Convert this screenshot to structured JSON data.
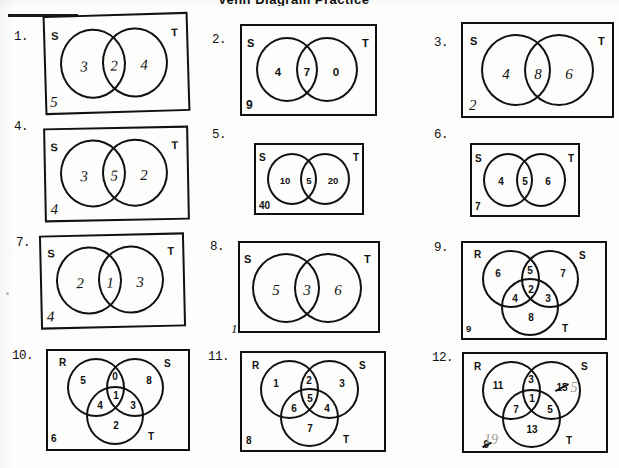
{
  "worksheet": {
    "title_fragment": "Venn Diagram Practice",
    "page_label": "Venn diagram worksheet (scanned, handwritten answers)"
  },
  "problems": [
    {
      "number": "1.",
      "type": "two-set",
      "set_labels": {
        "left": "S",
        "right": "T"
      },
      "regions": {
        "left_only": "3",
        "intersection": "2",
        "right_only": "4"
      },
      "outside": "5",
      "handwriting": "hand",
      "tilted": true
    },
    {
      "number": "2.",
      "type": "two-set",
      "set_labels": {
        "left": "S",
        "right": "T"
      },
      "regions": {
        "left_only": "4",
        "intersection": "7",
        "right_only": "0"
      },
      "outside": "9",
      "handwriting": "print",
      "tilted": false
    },
    {
      "number": "3.",
      "type": "two-set",
      "set_labels": {
        "left": "S",
        "right": "T"
      },
      "regions": {
        "left_only": "4",
        "intersection": "8",
        "right_only": "6"
      },
      "outside": "2",
      "handwriting": "hand",
      "tilted": false
    },
    {
      "number": "4.",
      "type": "two-set",
      "set_labels": {
        "left": "S",
        "right": "T"
      },
      "regions": {
        "left_only": "3",
        "intersection": "5",
        "right_only": "2"
      },
      "outside": "4",
      "handwriting": "hand",
      "tilted": true
    },
    {
      "number": "5.",
      "type": "two-set",
      "set_labels": {
        "left": "S",
        "right": "T"
      },
      "regions": {
        "left_only": "10",
        "intersection": "5",
        "right_only": "20"
      },
      "outside": "40",
      "handwriting": "print",
      "tilted": false
    },
    {
      "number": "6.",
      "type": "two-set",
      "set_labels": {
        "left": "S",
        "right": "T"
      },
      "regions": {
        "left_only": "4",
        "intersection": "5",
        "right_only": "6"
      },
      "outside": "7",
      "handwriting": "print",
      "tilted": false
    },
    {
      "number": "7.",
      "type": "two-set",
      "set_labels": {
        "left": "S",
        "right": "T"
      },
      "regions": {
        "left_only": "2",
        "intersection": "1",
        "right_only": "3"
      },
      "outside": "4",
      "handwriting": "hand",
      "tilted": true
    },
    {
      "number": "8.",
      "type": "two-set",
      "set_labels": {
        "left": "S",
        "right": "T"
      },
      "regions": {
        "left_only": "5",
        "intersection": "3",
        "right_only": "6"
      },
      "outside": "1",
      "handwriting": "hand",
      "tilted": false
    },
    {
      "number": "9.",
      "type": "three-set",
      "set_labels": {
        "left": "R",
        "right": "S",
        "bottom": "T"
      },
      "regions": {
        "r_only": "6",
        "rs": "5",
        "s_only": "7",
        "rt": "4",
        "center": "2",
        "st": "3",
        "t_only": "8"
      },
      "outside": "9",
      "handwriting": "print",
      "tilted": false
    },
    {
      "number": "10.",
      "type": "three-set",
      "set_labels": {
        "left": "R",
        "right": "S",
        "bottom": "T"
      },
      "regions": {
        "r_only": "5",
        "rs": "0",
        "s_only": "8",
        "rt": "4",
        "center": "1",
        "st": "3",
        "t_only": "2"
      },
      "outside": "6",
      "handwriting": "print",
      "tilted": false
    },
    {
      "number": "11.",
      "type": "three-set",
      "set_labels": {
        "left": "R",
        "right": "S",
        "bottom": "T"
      },
      "regions": {
        "r_only": "1",
        "rs": "2",
        "s_only": "3",
        "rt": "6",
        "center": "5",
        "st": "4",
        "t_only": "7"
      },
      "outside": "8",
      "handwriting": "print",
      "tilted": false
    },
    {
      "number": "12.",
      "type": "three-set",
      "set_labels": {
        "left": "R",
        "right": "S",
        "bottom": "T"
      },
      "regions": {
        "r_only": "11",
        "rs": "3",
        "s_only": "15",
        "rt": "7",
        "center": "1",
        "st": "5",
        "t_only": "13"
      },
      "s_only_corrected": "5",
      "outside": "9",
      "outside_corrected": "19",
      "handwriting": "print",
      "has_corrections": true,
      "tilted": false
    }
  ]
}
